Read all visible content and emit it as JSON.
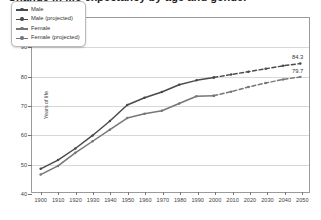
{
  "chart_data": {
    "type": "line",
    "title": "Change in life expectancy by age and gender",
    "xlabel": "",
    "ylabel": "Years of life",
    "xlim": [
      1895,
      2055
    ],
    "ylim": [
      40,
      100
    ],
    "yticks": [
      40,
      50,
      60,
      70,
      80,
      90,
      100
    ],
    "xticks": [
      1900,
      1910,
      1920,
      1930,
      1940,
      1950,
      1960,
      1970,
      1980,
      1990,
      2000,
      2010,
      2020,
      2030,
      2040,
      2050
    ],
    "grid": "horizontal",
    "legend_position": "top-left",
    "series": [
      {
        "name": "Male",
        "style": "solid",
        "color": "#4a4a4a",
        "x": [
          1900,
          1910,
          1920,
          1930,
          1940,
          1950,
          1960,
          1970,
          1980,
          1990,
          2000
        ],
        "values": [
          48.0,
          51.0,
          55.0,
          59.5,
          64.5,
          70.0,
          72.5,
          74.5,
          77.0,
          78.5,
          79.5
        ]
      },
      {
        "name": "Male (projected)",
        "style": "dashed",
        "color": "#4a4a4a",
        "x": [
          2000,
          2010,
          2020,
          2030,
          2040,
          2050
        ],
        "values": [
          79.5,
          80.5,
          81.5,
          82.5,
          83.5,
          84.3
        ]
      },
      {
        "name": "Female",
        "style": "solid",
        "color": "#767676",
        "x": [
          1900,
          1910,
          1920,
          1930,
          1940,
          1950,
          1960,
          1970,
          1980,
          1990,
          2000
        ],
        "values": [
          46.0,
          49.0,
          53.5,
          57.5,
          61.5,
          65.5,
          67.0,
          68.0,
          70.5,
          73.0,
          73.2
        ]
      },
      {
        "name": "Female (projected)",
        "style": "dashed",
        "color": "#767676",
        "x": [
          2000,
          2010,
          2020,
          2030,
          2040,
          2050
        ],
        "values": [
          73.2,
          74.6,
          76.2,
          77.6,
          78.8,
          79.7
        ]
      }
    ],
    "annotations": [
      {
        "name": "male-end-value",
        "text": "84.3",
        "x": 2050,
        "y": 84.3
      },
      {
        "name": "female-end-value",
        "text": "79.7",
        "x": 2050,
        "y": 79.7
      }
    ]
  },
  "legend": {
    "items": [
      {
        "label": "Male",
        "color": "#4a4a4a",
        "style": "solid"
      },
      {
        "label": "Male (projected)",
        "color": "#4a4a4a",
        "style": "solid"
      },
      {
        "label": "Female",
        "color": "#767676",
        "style": "solid"
      },
      {
        "label": "Female (projected)",
        "color": "#767676",
        "style": "solid"
      }
    ]
  }
}
